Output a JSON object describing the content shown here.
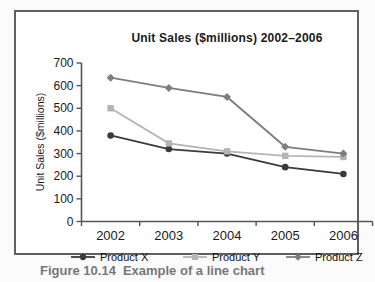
{
  "figure": {
    "caption_label": "Figure 10.14",
    "caption_text": "Example of a line chart"
  },
  "chart_data": {
    "type": "line",
    "title": "Unit Sales ($millions) 2002–2006",
    "ylabel": "Unit Sales ($millions)",
    "xlabel": "",
    "categories": [
      "2002",
      "2003",
      "2004",
      "2005",
      "2006"
    ],
    "series": [
      {
        "name": "Product X",
        "marker": "circle",
        "color": "#3a3a3a",
        "values": [
          380,
          320,
          300,
          240,
          210
        ]
      },
      {
        "name": "Product Y",
        "marker": "square",
        "color": "#b4b4b4",
        "values": [
          500,
          345,
          310,
          290,
          285
        ]
      },
      {
        "name": "Product Z",
        "marker": "diamond",
        "color": "#7e7e7e",
        "values": [
          635,
          590,
          550,
          330,
          300
        ]
      }
    ],
    "ylim": [
      0,
      700
    ],
    "yticks": [
      0,
      100,
      200,
      300,
      400,
      500,
      600,
      700
    ],
    "grid": false,
    "legend_position": "bottom",
    "axis_color": "#555555",
    "text_color": "#1a1a1a",
    "border_color": "#606060"
  }
}
